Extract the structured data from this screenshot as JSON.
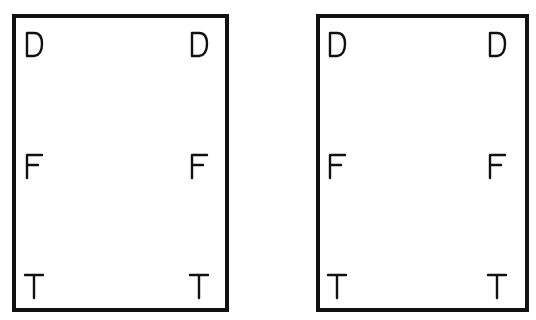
{
  "diagram": {
    "panels": [
      {
        "id": "left",
        "rows": [
          {
            "left": "D",
            "right": "D"
          },
          {
            "left": "F",
            "right": "F"
          },
          {
            "left": "T",
            "right": "T"
          }
        ]
      },
      {
        "id": "right",
        "rows": [
          {
            "left": "D",
            "right": "D"
          },
          {
            "left": "F",
            "right": "F"
          },
          {
            "left": "T",
            "right": "T"
          }
        ]
      }
    ],
    "colors": {
      "stroke": "#111111",
      "background": "#ffffff"
    }
  }
}
